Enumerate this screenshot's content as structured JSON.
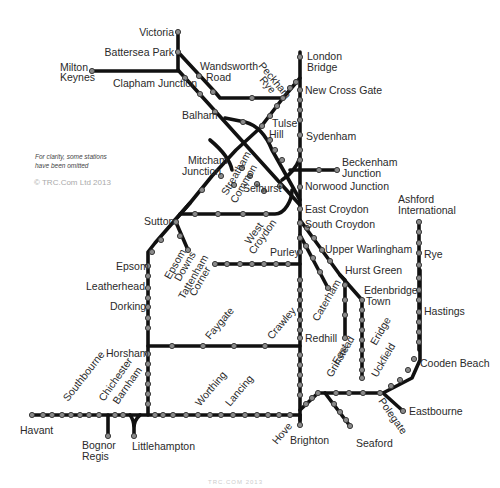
{
  "map": {
    "title": "South East rail network",
    "note_line1": "For clarity, some stations",
    "note_line2": "have been omitted",
    "copyright": "© TRC.Com Ltd 2013",
    "footer": "TRC.COM 2013",
    "line_color": "#111111",
    "station_color": "#8a8a8a"
  },
  "stations": {
    "victoria": "Victoria",
    "battersea_park": "Battersea Park",
    "milton_keynes_1": "Milton",
    "milton_keynes_2": "Keynes",
    "clapham_junction": "Clapham Junction",
    "wandsworth_road_1": "Wandsworth",
    "wandsworth_road_2": "Road",
    "peckham_rye_1": "Peckham",
    "peckham_rye_2": "Rye",
    "london_bridge_1": "London",
    "london_bridge_2": "Bridge",
    "new_cross_gate": "New Cross Gate",
    "balham": "Balham",
    "tulse_hill_1": "Tulse",
    "tulse_hill_2": "Hill",
    "sydenham": "Sydenham",
    "mitcham_junction_1": "Mitcham",
    "mitcham_junction_2": "Junction",
    "streatham_common_1": "Streatham",
    "streatham_common_2": "Common",
    "beckenham_junction_1": "Beckenham",
    "beckenham_junction_2": "Junction",
    "selhurst": "Selhurst",
    "norwood_junction": "Norwood Junction",
    "east_croydon": "East Croydon",
    "south_croydon": "South Croydon",
    "west_croydon_1": "West",
    "west_croydon_2": "Croydon",
    "sutton": "Sutton",
    "ashford_international_1": "Ashford",
    "ashford_international_2": "International",
    "rye": "Rye",
    "upper_warlingham": "Upper Warlingham",
    "purley": "Purley",
    "epsom": "Epsom",
    "epsom_downs_1": "Epsom",
    "epsom_downs_2": "Downs",
    "tattenham_corner_1": "Tattenham",
    "tattenham_corner_2": "Corner",
    "hurst_green": "Hurst Green",
    "leatherhead": "Leatherhead",
    "edenbridge_town_1": "Edenbridge",
    "edenbridge_town_2": "Town",
    "dorking": "Dorking",
    "caterham": "Caterham",
    "hastings": "Hastings",
    "faygate": "Faygate",
    "crawley": "Crawley",
    "redhill": "Redhill",
    "east_grinstead_1": "East",
    "east_grinstead_2": "Grinstead",
    "eridge": "Eridge",
    "uckfield": "Uckfield",
    "horsham": "Horsham",
    "cooden_beach": "Cooden Beach",
    "southbourne": "Southbourne",
    "chichester": "Chichester",
    "barnham": "Barnham",
    "worthing": "Worthing",
    "lancing": "Lancing",
    "eastbourne": "Eastbourne",
    "polegate": "Polegate",
    "havant": "Havant",
    "hove": "Hove",
    "brighton": "Brighton",
    "seaford": "Seaford",
    "bognor_regis_1": "Bognor",
    "bognor_regis_2": "Regis",
    "littlehampton": "Littlehampton"
  }
}
